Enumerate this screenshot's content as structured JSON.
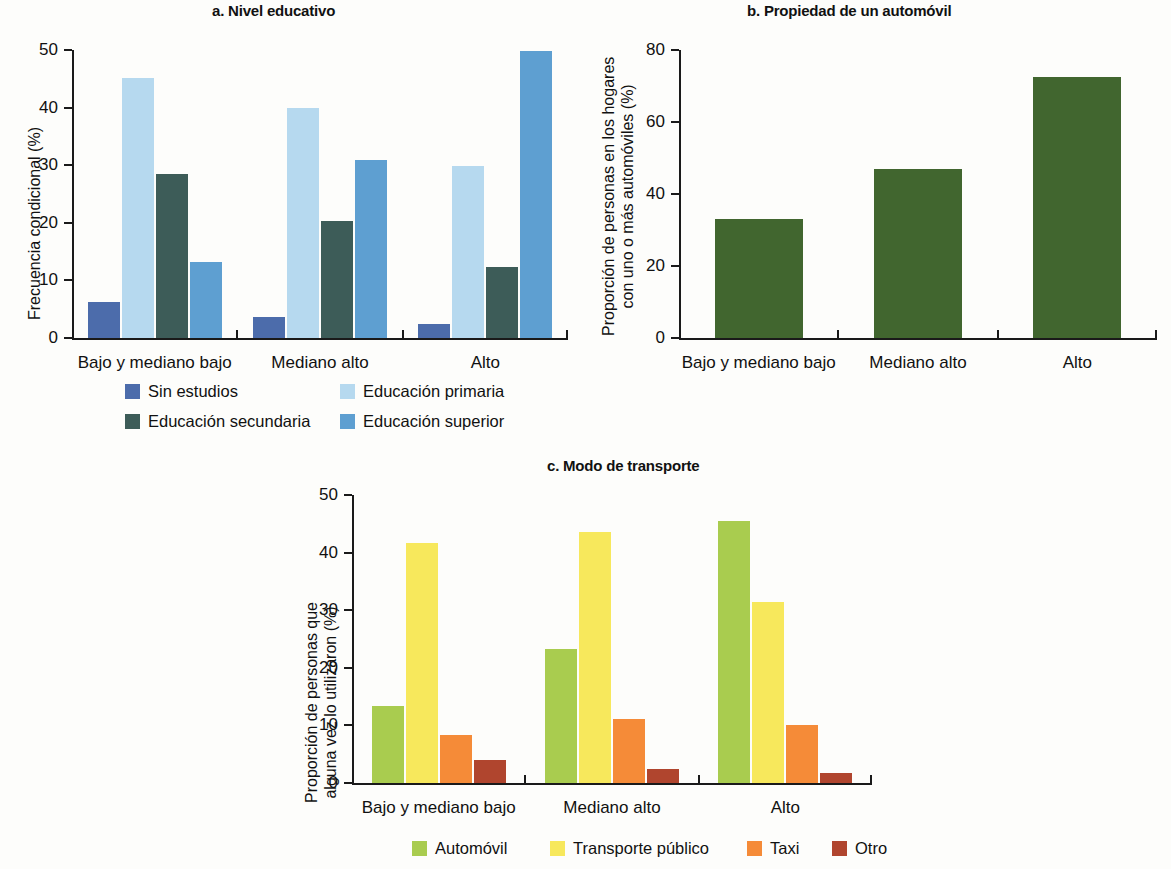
{
  "figure": {
    "background": "#fdfdfb"
  },
  "panels": {
    "a": {
      "title": "a. Nivel educativo",
      "ylabel": "Frecuencia condicional (%)",
      "y_ticks": [
        "0",
        "10",
        "20",
        "30",
        "40",
        "50"
      ],
      "categories": [
        "Bajo y mediano bajo",
        "Mediano alto",
        "Alto"
      ],
      "legend": [
        {
          "label": "Sin estudios",
          "color": "#4c6cab"
        },
        {
          "label": "Educación primaria",
          "color": "#b6d9ef"
        },
        {
          "label": "Educación secundaria",
          "color": "#3d5c58"
        },
        {
          "label": "Educación superior",
          "color": "#5e9fd1"
        }
      ]
    },
    "b": {
      "title": "b. Propiedad de un automóvil",
      "ylabel_line1": "Proporción de personas en los hogares",
      "ylabel_line2": "con uno o más automóviles (%)",
      "y_ticks": [
        "0",
        "20",
        "40",
        "60",
        "80"
      ],
      "categories": [
        "Bajo y mediano bajo",
        "Mediano alto",
        "Alto"
      ],
      "bar_color": "#41662f"
    },
    "c": {
      "title": "c. Modo de transporte",
      "ylabel_line1": "Proporción de personas que",
      "ylabel_line2": "alguna vez lo utilizaron (%)",
      "y_ticks": [
        "0",
        "10",
        "20",
        "30",
        "40",
        "50"
      ],
      "categories": [
        "Bajo y mediano bajo",
        "Mediano alto",
        "Alto"
      ],
      "legend": [
        {
          "label": "Automóvil",
          "color": "#a9cc4f"
        },
        {
          "label": "Transporte público",
          "color": "#f7e85c"
        },
        {
          "label": "Taxi",
          "color": "#f58b38"
        },
        {
          "label": "Otro",
          "color": "#b0452e"
        }
      ]
    }
  },
  "chart_data": [
    {
      "id": "a",
      "type": "bar",
      "title": "a. Nivel educativo",
      "xlabel": "",
      "ylabel": "Frecuencia condicional (%)",
      "ylim": [
        0,
        50
      ],
      "yticks": [
        0,
        10,
        20,
        30,
        40,
        50
      ],
      "grid": false,
      "legend_position": "below",
      "categories": [
        "Bajo y mediano bajo",
        "Mediano alto",
        "Alto"
      ],
      "series": [
        {
          "name": "Sin estudios",
          "color": "#4c6cab",
          "values": [
            6.3,
            3.7,
            2.4
          ]
        },
        {
          "name": "Educación primaria",
          "color": "#b6d9ef",
          "values": [
            45.2,
            39.9,
            29.8
          ]
        },
        {
          "name": "Educación secundaria",
          "color": "#3d5c58",
          "values": [
            28.4,
            20.3,
            12.4
          ]
        },
        {
          "name": "Educación superior",
          "color": "#5e9fd1",
          "values": [
            13.2,
            30.9,
            49.8
          ]
        }
      ]
    },
    {
      "id": "b",
      "type": "bar",
      "title": "b. Propiedad de un automóvil",
      "xlabel": "",
      "ylabel": "Proporción de personas en los hogares con uno o más automóviles (%)",
      "ylim": [
        0,
        80
      ],
      "yticks": [
        0,
        20,
        40,
        60,
        80
      ],
      "grid": false,
      "legend_position": "none",
      "categories": [
        "Bajo y mediano bajo",
        "Mediano alto",
        "Alto"
      ],
      "values": [
        33.0,
        47.0,
        72.5
      ],
      "color": "#41662f"
    },
    {
      "id": "c",
      "type": "bar",
      "title": "c. Modo de transporte",
      "xlabel": "",
      "ylabel": "Proporción de personas que alguna vez lo utilizaron (%)",
      "ylim": [
        0,
        50
      ],
      "yticks": [
        0,
        10,
        20,
        30,
        40,
        50
      ],
      "grid": false,
      "legend_position": "below",
      "categories": [
        "Bajo y mediano bajo",
        "Mediano alto",
        "Alto"
      ],
      "series": [
        {
          "name": "Automóvil",
          "color": "#a9cc4f",
          "values": [
            13.3,
            23.3,
            45.5
          ]
        },
        {
          "name": "Transporte público",
          "color": "#f7e85c",
          "values": [
            41.7,
            43.6,
            31.4
          ]
        },
        {
          "name": "Taxi",
          "color": "#f58b38",
          "values": [
            8.4,
            11.1,
            10.0
          ]
        },
        {
          "name": "Otro",
          "color": "#b0452e",
          "values": [
            4.0,
            2.4,
            1.7
          ]
        }
      ]
    }
  ]
}
